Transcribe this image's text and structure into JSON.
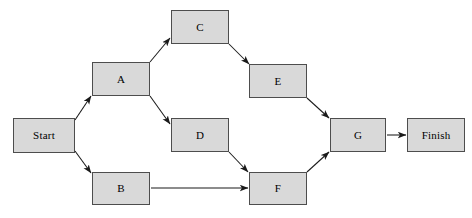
{
  "diagram": {
    "type": "directed-graph",
    "canvas": {
      "width": 472,
      "height": 218
    },
    "style": {
      "node_fill": "#d9d9d9",
      "node_border": "#4d4d4d",
      "edge_color": "#1a1a1a",
      "background": "#ffffff",
      "label_color": "#000000"
    },
    "nodes": [
      {
        "id": "start",
        "label": "Start",
        "x": 13,
        "y": 118,
        "w": 62,
        "h": 35
      },
      {
        "id": "a",
        "label": "A",
        "x": 92,
        "y": 62,
        "w": 58,
        "h": 34
      },
      {
        "id": "b",
        "label": "B",
        "x": 92,
        "y": 172,
        "w": 58,
        "h": 33
      },
      {
        "id": "c",
        "label": "C",
        "x": 171,
        "y": 10,
        "w": 58,
        "h": 34
      },
      {
        "id": "d",
        "label": "D",
        "x": 171,
        "y": 118,
        "w": 58,
        "h": 34
      },
      {
        "id": "e",
        "label": "E",
        "x": 249,
        "y": 64,
        "w": 58,
        "h": 34
      },
      {
        "id": "f",
        "label": "F",
        "x": 249,
        "y": 172,
        "w": 58,
        "h": 33
      },
      {
        "id": "g",
        "label": "G",
        "x": 330,
        "y": 118,
        "w": 56,
        "h": 34
      },
      {
        "id": "finish",
        "label": "Finish",
        "x": 407,
        "y": 118,
        "w": 58,
        "h": 34
      }
    ],
    "edges": [
      {
        "id": "start-a",
        "from": "start",
        "to": "a",
        "x1": 75,
        "y1": 120,
        "x2": 91,
        "y2": 96
      },
      {
        "id": "start-b",
        "from": "start",
        "to": "b",
        "x1": 75,
        "y1": 151,
        "x2": 91,
        "y2": 173
      },
      {
        "id": "a-c",
        "from": "a",
        "to": "c",
        "x1": 150,
        "y1": 62,
        "x2": 170,
        "y2": 38
      },
      {
        "id": "a-d",
        "from": "a",
        "to": "d",
        "x1": 150,
        "y1": 96,
        "x2": 170,
        "y2": 124
      },
      {
        "id": "c-e",
        "from": "c",
        "to": "e",
        "x1": 229,
        "y1": 44,
        "x2": 249,
        "y2": 64
      },
      {
        "id": "d-f",
        "from": "d",
        "to": "f",
        "x1": 229,
        "y1": 152,
        "x2": 248,
        "y2": 172
      },
      {
        "id": "b-f",
        "from": "b",
        "to": "f",
        "x1": 151,
        "y1": 188,
        "x2": 248,
        "y2": 188
      },
      {
        "id": "e-g",
        "from": "e",
        "to": "g",
        "x1": 307,
        "y1": 98,
        "x2": 329,
        "y2": 118
      },
      {
        "id": "f-g",
        "from": "f",
        "to": "g",
        "x1": 307,
        "y1": 172,
        "x2": 329,
        "y2": 152
      },
      {
        "id": "g-finish",
        "from": "g",
        "to": "finish",
        "x1": 387,
        "y1": 135,
        "x2": 406,
        "y2": 135
      }
    ]
  }
}
